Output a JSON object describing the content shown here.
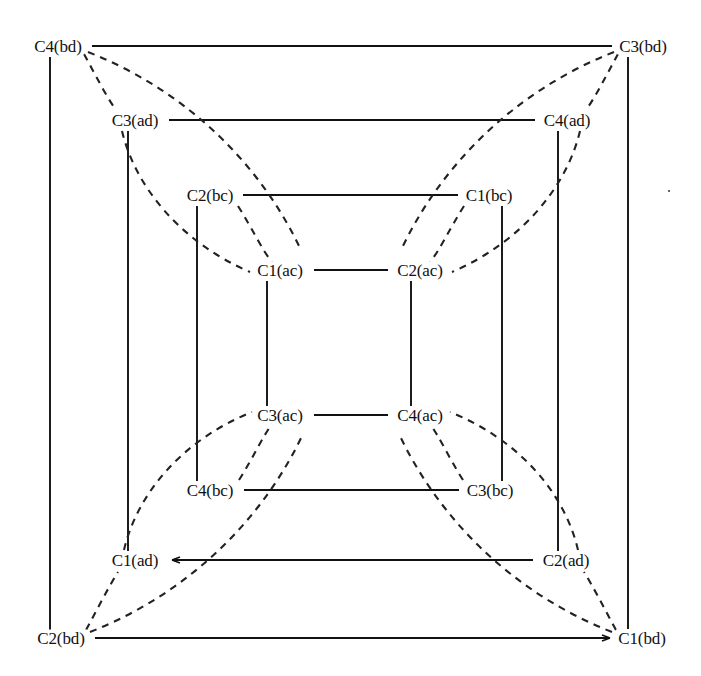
{
  "figure": {
    "kind": "graph-diagram",
    "background_color": "#ffffff",
    "line_color": "#111111",
    "dash_color": "#222222",
    "width": 701,
    "height": 676
  },
  "nodes": [
    {
      "id": "C4bd",
      "label": "C4(bd)",
      "x": 58,
      "y": 46,
      "ring": "bd",
      "corner": "top-left"
    },
    {
      "id": "C3bd",
      "label": "C3(bd)",
      "x": 643,
      "y": 46,
      "ring": "bd",
      "corner": "top-right"
    },
    {
      "id": "C2bd",
      "label": "C2(bd)",
      "x": 61,
      "y": 638,
      "ring": "bd",
      "corner": "bottom-left"
    },
    {
      "id": "C1bd",
      "label": "C1(bd)",
      "x": 642,
      "y": 638,
      "ring": "bd",
      "corner": "bottom-right"
    },
    {
      "id": "C3ad",
      "label": "C3(ad)",
      "x": 135,
      "y": 120,
      "ring": "ad",
      "corner": "top-left"
    },
    {
      "id": "C4ad",
      "label": "C4(ad)",
      "x": 567,
      "y": 120,
      "ring": "ad",
      "corner": "top-right"
    },
    {
      "id": "C1ad",
      "label": "C1(ad)",
      "x": 135,
      "y": 560,
      "ring": "ad",
      "corner": "bottom-left"
    },
    {
      "id": "C2ad",
      "label": "C2(ad)",
      "x": 566,
      "y": 560,
      "ring": "ad",
      "corner": "bottom-right"
    },
    {
      "id": "C2bc",
      "label": "C2(bc)",
      "x": 210,
      "y": 195,
      "ring": "bc",
      "corner": "top-left"
    },
    {
      "id": "C1bc",
      "label": "C1(bc)",
      "x": 489,
      "y": 195,
      "ring": "bc",
      "corner": "top-right"
    },
    {
      "id": "C4bc",
      "label": "C4(bc)",
      "x": 210,
      "y": 490,
      "ring": "bc",
      "corner": "bottom-left"
    },
    {
      "id": "C3bc",
      "label": "C3(bc)",
      "x": 490,
      "y": 490,
      "ring": "bc",
      "corner": "bottom-right"
    },
    {
      "id": "C1ac",
      "label": "C1(ac)",
      "x": 280,
      "y": 270,
      "ring": "ac",
      "corner": "top-left"
    },
    {
      "id": "C2ac",
      "label": "C2(ac)",
      "x": 420,
      "y": 270,
      "ring": "ac",
      "corner": "top-right"
    },
    {
      "id": "C3ac",
      "label": "C3(ac)",
      "x": 280,
      "y": 415,
      "ring": "ac",
      "corner": "bottom-left"
    },
    {
      "id": "C4ac",
      "label": "C4(ac)",
      "x": 420,
      "y": 415,
      "ring": "ac",
      "corner": "bottom-right"
    }
  ],
  "solid_edges": [
    {
      "from": "C4bd",
      "to": "C3bd",
      "orientation": "horizontal"
    },
    {
      "from": "C2bd",
      "to": "C1bd",
      "orientation": "horizontal"
    },
    {
      "from": "C4bd",
      "to": "C2bd",
      "orientation": "vertical"
    },
    {
      "from": "C3bd",
      "to": "C1bd",
      "orientation": "vertical"
    },
    {
      "from": "C3ad",
      "to": "C4ad",
      "orientation": "horizontal"
    },
    {
      "from": "C1ad",
      "to": "C2ad",
      "orientation": "horizontal"
    },
    {
      "from": "C3ad",
      "to": "C1ad",
      "orientation": "vertical"
    },
    {
      "from": "C4ad",
      "to": "C2ad",
      "orientation": "vertical"
    },
    {
      "from": "C2bc",
      "to": "C1bc",
      "orientation": "horizontal"
    },
    {
      "from": "C4bc",
      "to": "C3bc",
      "orientation": "horizontal"
    },
    {
      "from": "C2bc",
      "to": "C4bc",
      "orientation": "vertical"
    },
    {
      "from": "C1bc",
      "to": "C3bc",
      "orientation": "vertical"
    },
    {
      "from": "C1ac",
      "to": "C2ac",
      "orientation": "horizontal"
    },
    {
      "from": "C3ac",
      "to": "C4ac",
      "orientation": "horizontal"
    },
    {
      "from": "C1ac",
      "to": "C3ac",
      "orientation": "vertical"
    },
    {
      "from": "C2ac",
      "to": "C4ac",
      "orientation": "vertical"
    }
  ],
  "dashed_edges": [
    {
      "from": "C4bd",
      "to": "C3ad"
    },
    {
      "from": "C4bd",
      "to": "C1ac"
    },
    {
      "from": "C3ad",
      "to": "C1ac"
    },
    {
      "from": "C2bc",
      "to": "C1ac"
    },
    {
      "from": "C3bd",
      "to": "C4ad"
    },
    {
      "from": "C3bd",
      "to": "C2ac"
    },
    {
      "from": "C4ad",
      "to": "C2ac"
    },
    {
      "from": "C1bc",
      "to": "C2ac"
    },
    {
      "from": "C2bd",
      "to": "C1ad"
    },
    {
      "from": "C2bd",
      "to": "C3ac"
    },
    {
      "from": "C1ad",
      "to": "C3ac"
    },
    {
      "from": "C4bc",
      "to": "C3ac"
    },
    {
      "from": "C1bd",
      "to": "C2ad"
    },
    {
      "from": "C1bd",
      "to": "C4ac"
    },
    {
      "from": "C2ad",
      "to": "C4ac"
    },
    {
      "from": "C3bc",
      "to": "C4ac"
    }
  ],
  "geometry": {
    "rings": [
      {
        "name": "bd",
        "left": 50,
        "right": 628,
        "top": 55,
        "bottom": 630
      },
      {
        "name": "ad",
        "left": 128,
        "right": 558,
        "top": 129,
        "bottom": 551
      },
      {
        "name": "bc",
        "left": 197,
        "right": 502,
        "top": 204,
        "bottom": 481
      },
      {
        "name": "ac",
        "left": 267,
        "right": 411,
        "top": 279,
        "bottom": 406
      }
    ]
  }
}
